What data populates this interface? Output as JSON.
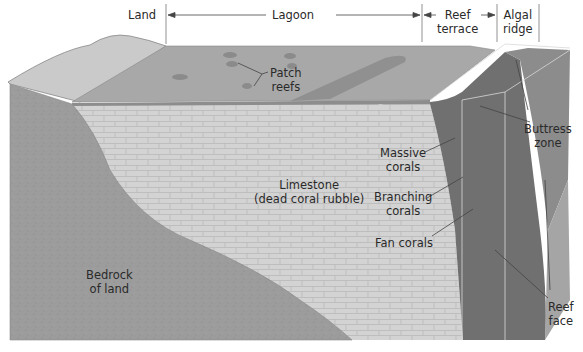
{
  "diagram": {
    "type": "block-diagram",
    "colors": {
      "land": "#c9c9c9",
      "lagoon": "#a6a6a6",
      "patch_reef": "#8a8a8a",
      "limestone": "#d2d2d2",
      "bedrock": "#9b9b9b",
      "reef_face": "#6e6e6e",
      "reef_side": "#858585",
      "text": "#2a2a2a"
    },
    "zones": {
      "land": "Land",
      "lagoon": "Lagoon",
      "reef_terrace_1": "Reef",
      "reef_terrace_2": "terrace",
      "algal_ridge_1": "Algal",
      "algal_ridge_2": "ridge"
    },
    "labels": {
      "patch_reefs_1": "Patch",
      "patch_reefs_2": "reefs",
      "buttress_1": "Buttress",
      "buttress_2": "zone",
      "massive_1": "Massive",
      "massive_2": "corals",
      "limestone_1": "Limestone",
      "limestone_2": "(dead coral rubble)",
      "branching_1": "Branching",
      "branching_2": "corals",
      "fan": "Fan corals",
      "bedrock_1": "Bedrock",
      "bedrock_2": "of land",
      "reef_face_1": "Reef",
      "reef_face_2": "face"
    }
  }
}
